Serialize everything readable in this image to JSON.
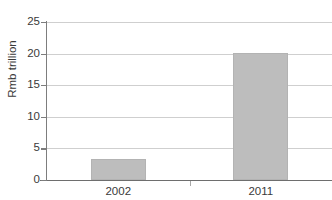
{
  "chart_data": {
    "type": "bar",
    "title": "",
    "xlabel": "",
    "ylabel": "Rmb trillion",
    "categories": [
      "2002",
      "2011"
    ],
    "values": [
      3.4,
      20.1
    ],
    "ylim": [
      0,
      25
    ],
    "yticks": [
      0,
      5,
      10,
      15,
      20,
      25
    ],
    "ytick_labels": [
      "0",
      "5",
      "10",
      "15",
      "20",
      "25"
    ],
    "grid": true,
    "legend": false,
    "series": [
      {
        "name": "Rmb trillion",
        "values": [
          3.4,
          20.1
        ]
      }
    ],
    "colors": {
      "bar_fill": "#bdbdbd",
      "bar_edge": "#b3b3b3",
      "gridline": "#cfcfcf",
      "axis": "#6e6e6e",
      "text": "#3a3a3a"
    }
  },
  "title_sliver": {
    "text": ""
  }
}
